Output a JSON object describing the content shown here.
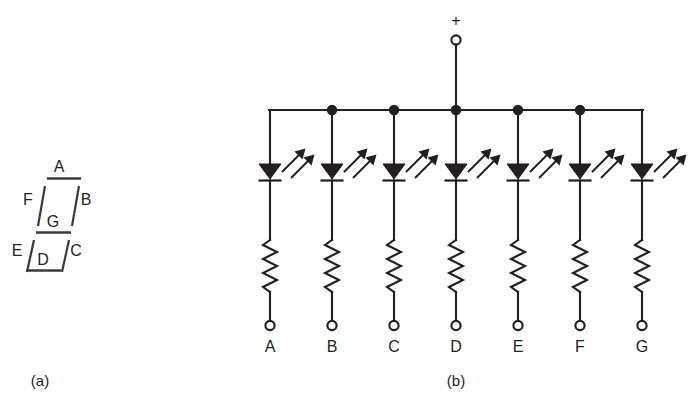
{
  "figure": {
    "background_color": "#ffffff",
    "ink_color": "#231f20",
    "display_ink_color": "#3a3a3c"
  },
  "panel_a": {
    "caption": "(a)",
    "title": "seven-segment-display-layout",
    "segments": [
      {
        "id": "A",
        "label": "A",
        "kind": "horizontal",
        "position": "top"
      },
      {
        "id": "B",
        "label": "B",
        "kind": "vertical",
        "position": "upper-right"
      },
      {
        "id": "C",
        "label": "C",
        "kind": "vertical",
        "position": "lower-right"
      },
      {
        "id": "D",
        "label": "D",
        "kind": "horizontal",
        "position": "bottom"
      },
      {
        "id": "E",
        "label": "E",
        "kind": "vertical",
        "position": "lower-left"
      },
      {
        "id": "F",
        "label": "F",
        "kind": "vertical",
        "position": "upper-left"
      },
      {
        "id": "G",
        "label": "G",
        "kind": "horizontal",
        "position": "middle"
      }
    ]
  },
  "panel_b": {
    "caption": "(b)",
    "title": "common-anode-led-schematic",
    "supply": {
      "polarity_label": "+",
      "terminal_type": "open-circle"
    },
    "branch_count": 7,
    "branches": [
      {
        "label": "A",
        "has_bus_node_dot": false,
        "component_order": [
          "led",
          "resistor",
          "terminal"
        ]
      },
      {
        "label": "B",
        "has_bus_node_dot": true,
        "component_order": [
          "led",
          "resistor",
          "terminal"
        ]
      },
      {
        "label": "C",
        "has_bus_node_dot": true,
        "component_order": [
          "led",
          "resistor",
          "terminal"
        ]
      },
      {
        "label": "D",
        "has_bus_node_dot": true,
        "component_order": [
          "led",
          "resistor",
          "terminal"
        ]
      },
      {
        "label": "E",
        "has_bus_node_dot": true,
        "component_order": [
          "led",
          "resistor",
          "terminal"
        ]
      },
      {
        "label": "F",
        "has_bus_node_dot": true,
        "component_order": [
          "led",
          "resistor",
          "terminal"
        ]
      },
      {
        "label": "G",
        "has_bus_node_dot": false,
        "component_order": [
          "led",
          "resistor",
          "terminal"
        ]
      }
    ],
    "symbols": {
      "led": "light-emitting-diode",
      "resistor": "zigzag-resistor",
      "terminal": "open-circle-terminal",
      "junction": "filled-node-dot"
    }
  }
}
